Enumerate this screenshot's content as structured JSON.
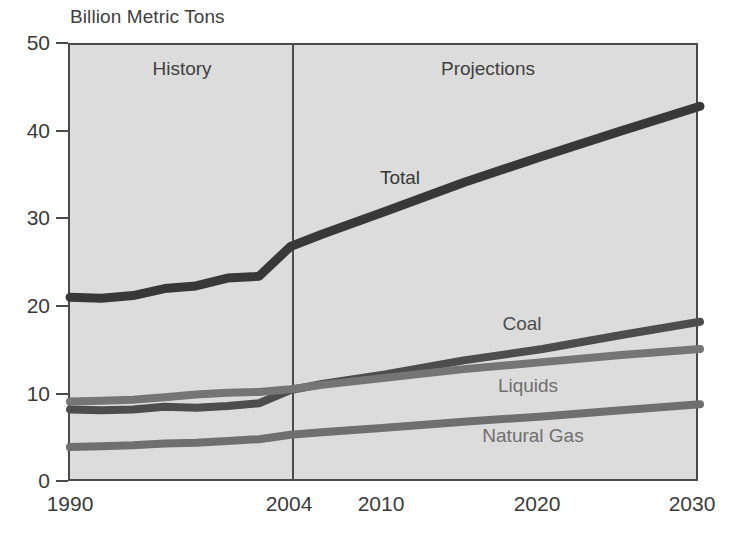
{
  "figure": {
    "y_axis_title": "Billion Metric Tons",
    "region_labels": {
      "history": "History",
      "projections": "Projections"
    },
    "series_labels": {
      "total": "Total",
      "coal": "Coal",
      "liquids": "Liquids",
      "natural_gas": "Natural Gas"
    }
  },
  "axes": {
    "y_ticks": [
      "50",
      "40",
      "30",
      "20",
      "10",
      "0"
    ],
    "x_ticks": [
      "1990",
      "2004",
      "2010",
      "2020",
      "2030"
    ]
  },
  "chart_data": {
    "type": "line",
    "title": "",
    "subtitle": "",
    "xlabel": "",
    "ylabel": "Billion Metric Tons",
    "xlim": [
      1990,
      2030
    ],
    "ylim": [
      0,
      50
    ],
    "grid": false,
    "legend": "inline-labels",
    "annotations": [
      {
        "text": "History",
        "x": 1997,
        "note": "left region, data before 2004"
      },
      {
        "text": "Projections",
        "x": 2017,
        "note": "right region, data after 2004"
      },
      {
        "text": "vertical divider at 2004 separating history from projections"
      }
    ],
    "x_tick_values": [
      1990,
      2004,
      2010,
      2020,
      2030
    ],
    "y_tick_values": [
      0,
      10,
      20,
      30,
      40,
      50
    ],
    "x": [
      1990,
      1992,
      1994,
      1996,
      1998,
      2000,
      2002,
      2004,
      2006,
      2010,
      2015,
      2020,
      2025,
      2030
    ],
    "series": [
      {
        "name": "Total",
        "color": "#383838",
        "values": [
          21.2,
          21.1,
          21.4,
          22.2,
          22.5,
          23.4,
          23.6,
          27.0,
          28.4,
          31.0,
          34.3,
          37.3,
          40.2,
          43.0
        ]
      },
      {
        "name": "Coal",
        "color": "#4d4d4d",
        "values": [
          8.4,
          8.3,
          8.4,
          8.7,
          8.6,
          8.8,
          9.1,
          10.6,
          11.3,
          12.4,
          14.0,
          15.3,
          16.9,
          18.4
        ]
      },
      {
        "name": "Liquids",
        "color": "#757575",
        "values": [
          9.3,
          9.4,
          9.5,
          9.8,
          10.1,
          10.3,
          10.4,
          10.7,
          11.2,
          12.0,
          13.0,
          13.8,
          14.6,
          15.3
        ]
      },
      {
        "name": "Natural Gas",
        "color": "#6f6f6f",
        "values": [
          4.1,
          4.2,
          4.3,
          4.5,
          4.6,
          4.8,
          5.0,
          5.5,
          5.8,
          6.3,
          7.0,
          7.6,
          8.3,
          9.0
        ]
      }
    ]
  }
}
